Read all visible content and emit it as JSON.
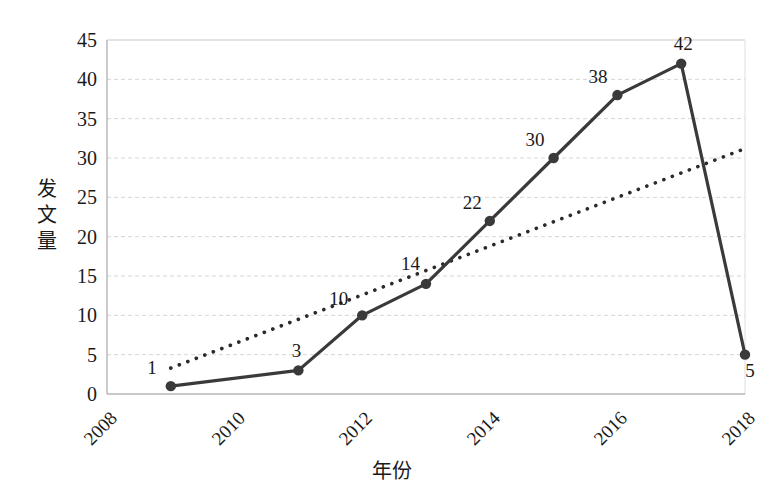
{
  "chart_data": {
    "type": "line",
    "title": "",
    "xlabel": "年份",
    "ylabel": "发文量",
    "x": [
      2009,
      2011,
      2012,
      2013,
      2014,
      2015,
      2016,
      2017,
      2018
    ],
    "values": [
      1,
      3,
      10,
      14,
      22,
      30,
      38,
      42,
      5
    ],
    "point_labels": [
      "1",
      "3",
      "10",
      "14",
      "22",
      "30",
      "38",
      "42",
      "5"
    ],
    "series": [
      {
        "name": "发文量",
        "style": "solid-line-with-markers",
        "color": "#3a3a3a",
        "values": [
          1,
          3,
          10,
          14,
          22,
          30,
          38,
          42,
          5
        ]
      },
      {
        "name": "趋势线",
        "style": "dotted-trendline",
        "color": "#2b2b2b",
        "x_endpoints": [
          2009,
          2018
        ],
        "y_endpoints": [
          3.3,
          31.2
        ]
      }
    ],
    "xlim": [
      2008,
      2018
    ],
    "ylim": [
      0,
      45
    ],
    "xticks": [
      "2008",
      "2010",
      "2012",
      "2014",
      "2016",
      "2018"
    ],
    "xtick_values": [
      2008,
      2010,
      2012,
      2014,
      2016,
      2018
    ],
    "yticks": [
      "0",
      "5",
      "10",
      "15",
      "20",
      "25",
      "30",
      "35",
      "40",
      "45"
    ],
    "ytick_values": [
      0,
      5,
      10,
      15,
      20,
      25,
      30,
      35,
      40,
      45
    ],
    "grid": true,
    "grid_color": "#d6d6d6",
    "legend": "none",
    "axis_color": "#b5b5b5",
    "xtick_rotation": -45
  },
  "axes": {
    "y_title_chars": [
      "发",
      "文",
      "量"
    ],
    "x_title": "年份"
  }
}
